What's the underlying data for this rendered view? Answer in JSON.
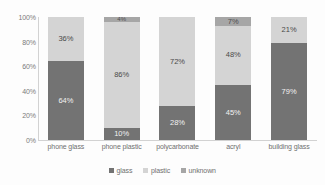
{
  "chart_data": {
    "type": "bar",
    "stacked": true,
    "normalized": true,
    "title": "",
    "xlabel": "",
    "ylabel": "",
    "ylim": [
      0,
      100
    ],
    "ytick_labels": [
      "100%",
      "80%",
      "60%",
      "40%",
      "20%",
      "0%"
    ],
    "ytick_values": [
      100,
      80,
      60,
      40,
      20,
      0
    ],
    "grid": false,
    "legend_position": "bottom",
    "categories": [
      "phone glass",
      "phone plastic",
      "polycarbonate",
      "acryl",
      "building glass"
    ],
    "series": [
      {
        "name": "glass",
        "color": "#737373",
        "values": [
          64,
          10,
          28,
          45,
          79
        ],
        "labels": [
          "64%",
          "10%",
          "28%",
          "45%",
          "79%"
        ]
      },
      {
        "name": "plastic",
        "color": "#d4d4d4",
        "values": [
          36,
          86,
          72,
          48,
          21
        ],
        "labels": [
          "36%",
          "86%",
          "72%",
          "48%",
          "21%"
        ]
      },
      {
        "name": "unknown",
        "color": "#a6a6a6",
        "values": [
          0,
          4,
          0,
          7,
          0
        ],
        "labels": [
          "",
          "4%",
          "",
          "7%",
          ""
        ]
      }
    ]
  },
  "legend": {
    "items": [
      {
        "label": "glass",
        "color": "#737373"
      },
      {
        "label": "plastic",
        "color": "#d4d4d4"
      },
      {
        "label": "unknown",
        "color": "#a6a6a6"
      }
    ]
  }
}
